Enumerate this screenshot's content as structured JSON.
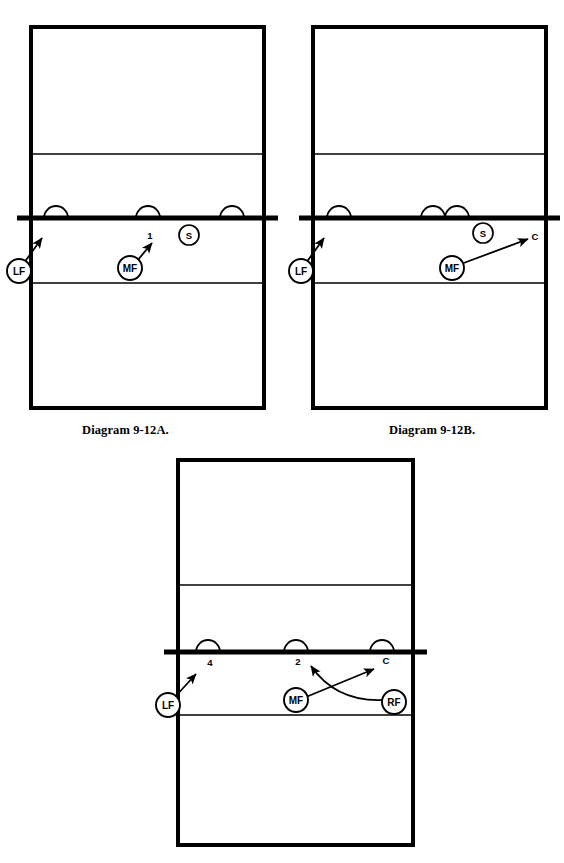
{
  "page": {
    "background": "#ffffff",
    "ink": "#000000",
    "width": 564,
    "height": 863
  },
  "diagrams": [
    {
      "id": "diagram-a",
      "caption": "Diagram 9-12A.",
      "court": {
        "x": 31,
        "y": 27,
        "w": 233,
        "h": 381,
        "border_color": "#000000",
        "attack_line_top_y": 154,
        "attack_line_bottom_y": 283,
        "net_y": 218,
        "net_overhang_left": 14,
        "net_overhang_right": 14
      },
      "blockers": [
        {
          "name": "blocker-arc-left",
          "cx": 56,
          "r": 12
        },
        {
          "name": "blocker-arc-middle",
          "cx": 148,
          "r": 12
        },
        {
          "name": "blocker-arc-right",
          "cx": 232,
          "r": 12
        }
      ],
      "players": [
        {
          "id": "LF",
          "label": "LF",
          "cx": 19,
          "cy": 271,
          "r": 12
        },
        {
          "id": "MF",
          "label": "MF",
          "cx": 130,
          "cy": 268,
          "r": 12
        },
        {
          "id": "S",
          "label": "S",
          "cx": 189,
          "cy": 235,
          "r": 10
        }
      ],
      "zone_labels": [
        {
          "id": "zone-1",
          "text": "1",
          "x": 150,
          "y": 235
        }
      ],
      "arrows": [
        {
          "id": "arrow-lf",
          "type": "straight",
          "x1": 24,
          "y1": 263,
          "x2": 42,
          "y2": 238
        },
        {
          "id": "arrow-mf",
          "type": "straight",
          "x1": 137,
          "y1": 261,
          "x2": 152,
          "y2": 243
        }
      ]
    },
    {
      "id": "diagram-b",
      "caption": "Diagram 9-12B.",
      "court": {
        "x": 313,
        "y": 27,
        "w": 233,
        "h": 381,
        "border_color": "#000000",
        "attack_line_top_y": 154,
        "attack_line_bottom_y": 283,
        "net_y": 218,
        "net_overhang_left": 14,
        "net_overhang_right": 14
      },
      "blockers": [
        {
          "name": "blocker-arc-left",
          "cx": 339,
          "r": 12
        },
        {
          "name": "blocker-arc-middle-left",
          "cx": 433,
          "r": 12
        },
        {
          "name": "blocker-arc-middle-right",
          "cx": 457,
          "r": 12
        }
      ],
      "players": [
        {
          "id": "LF",
          "label": "LF",
          "cx": 301,
          "cy": 271,
          "r": 12
        },
        {
          "id": "MF",
          "label": "MF",
          "cx": 452,
          "cy": 268,
          "r": 12
        },
        {
          "id": "S",
          "label": "S",
          "cx": 483,
          "cy": 233,
          "r": 10
        }
      ],
      "zone_labels": [
        {
          "id": "zone-c",
          "text": "C",
          "x": 535,
          "y": 236
        }
      ],
      "arrows": [
        {
          "id": "arrow-lf",
          "type": "straight",
          "x1": 306,
          "y1": 263,
          "x2": 324,
          "y2": 238
        },
        {
          "id": "arrow-mf",
          "type": "straight",
          "x1": 461,
          "y1": 264,
          "x2": 528,
          "y2": 239
        }
      ]
    },
    {
      "id": "diagram-c",
      "caption": "",
      "court": {
        "x": 178,
        "y": 460,
        "w": 235,
        "h": 385,
        "border_color": "#000000",
        "attack_line_top_y": 585,
        "attack_line_bottom_y": 715,
        "net_y": 652,
        "net_overhang_left": 14,
        "net_overhang_right": 14
      },
      "blockers": [
        {
          "name": "blocker-arc-left",
          "cx": 208,
          "r": 12
        },
        {
          "name": "blocker-arc-middle",
          "cx": 296,
          "r": 12
        },
        {
          "name": "blocker-arc-right",
          "cx": 382,
          "r": 12
        }
      ],
      "players": [
        {
          "id": "LF",
          "label": "LF",
          "cx": 168,
          "cy": 705,
          "r": 12
        },
        {
          "id": "MF",
          "label": "MF",
          "cx": 296,
          "cy": 700,
          "r": 12
        },
        {
          "id": "RF",
          "label": "RF",
          "cx": 394,
          "cy": 702,
          "r": 12
        }
      ],
      "zone_labels": [
        {
          "id": "zone-4",
          "text": "4",
          "x": 210,
          "y": 662
        },
        {
          "id": "zone-2",
          "text": "2",
          "x": 298,
          "y": 661
        },
        {
          "id": "zone-c",
          "text": "C",
          "x": 386,
          "y": 660
        }
      ],
      "arrows": [
        {
          "id": "arrow-lf",
          "type": "straight",
          "x1": 174,
          "y1": 698,
          "x2": 196,
          "y2": 674
        },
        {
          "id": "arrow-mf",
          "type": "straight",
          "x1": 306,
          "y1": 697,
          "x2": 374,
          "y2": 669
        },
        {
          "id": "arrow-rf",
          "type": "curved",
          "x1": 383,
          "y1": 700,
          "cx": 336,
          "cy": 702,
          "x2": 311,
          "y2": 666
        }
      ]
    }
  ]
}
